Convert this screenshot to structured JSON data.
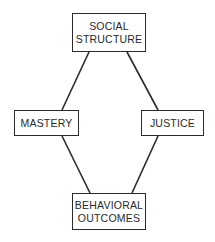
{
  "diagram": {
    "type": "relationship-diamond",
    "colors": {
      "line": "#2a2a2a",
      "background": "#ffffff",
      "text": "#2a2a2a"
    },
    "nodes": [
      {
        "id": "social_structure",
        "lines": [
          "SOCIAL",
          "STRUCTURE"
        ]
      },
      {
        "id": "mastery",
        "lines": [
          "MASTERY"
        ]
      },
      {
        "id": "justice",
        "lines": [
          "JUSTICE"
        ]
      },
      {
        "id": "behavioral_outcomes",
        "lines": [
          "BEHAVIORAL",
          "OUTCOMES"
        ]
      }
    ],
    "edges": [
      {
        "from": "social_structure",
        "to": "mastery"
      },
      {
        "from": "social_structure",
        "to": "justice"
      },
      {
        "from": "mastery",
        "to": "behavioral_outcomes"
      },
      {
        "from": "justice",
        "to": "behavioral_outcomes"
      }
    ]
  }
}
